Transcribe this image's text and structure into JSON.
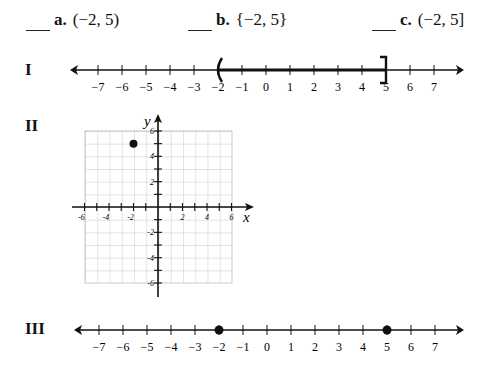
{
  "choices": [
    {
      "blank": "___",
      "letter": "a.",
      "expr": "(−2, 5)"
    },
    {
      "blank": "___",
      "letter": "b.",
      "expr": "{−2, 5}"
    },
    {
      "blank": "___",
      "letter": "c.",
      "expr": "(−2, 5]"
    }
  ],
  "figures": {
    "I": {
      "label": "I",
      "type": "number-line interval",
      "left_end": -2,
      "left_bracket": "(",
      "right_end": 5,
      "right_bracket": "]",
      "ticks": [
        -7,
        -6,
        -5,
        -4,
        -3,
        -2,
        -1,
        0,
        1,
        2,
        3,
        4,
        5,
        6,
        7
      ]
    },
    "II": {
      "label": "II",
      "type": "coordinate plane point",
      "point": [
        -2,
        5
      ],
      "x_axis_label": "x",
      "y_axis_label": "y",
      "x_tick_labels": [
        "-6",
        "-4",
        "-2",
        "2",
        "4",
        "6"
      ],
      "y_tick_labels": [
        "6",
        "4",
        "2",
        "-2",
        "-4",
        "-6"
      ]
    },
    "III": {
      "label": "III",
      "type": "number-line points",
      "points": [
        -2,
        5
      ],
      "ticks": [
        -7,
        -6,
        -5,
        -4,
        -3,
        -2,
        -1,
        0,
        1,
        2,
        3,
        4,
        5,
        6,
        7
      ]
    }
  },
  "tick_labels": [
    "−7",
    "−6",
    "−5",
    "−4",
    "−3",
    "−2",
    "−1",
    "0",
    "1",
    "2",
    "3",
    "4",
    "5",
    "6",
    "7"
  ],
  "graph_labels": {
    "x": "x",
    "y": "y",
    "xticks": [
      "-6",
      "-4",
      "-2",
      "2",
      "4",
      "6"
    ],
    "yticks": [
      "6",
      "4",
      "2",
      "-2",
      "-4",
      "-6"
    ]
  }
}
